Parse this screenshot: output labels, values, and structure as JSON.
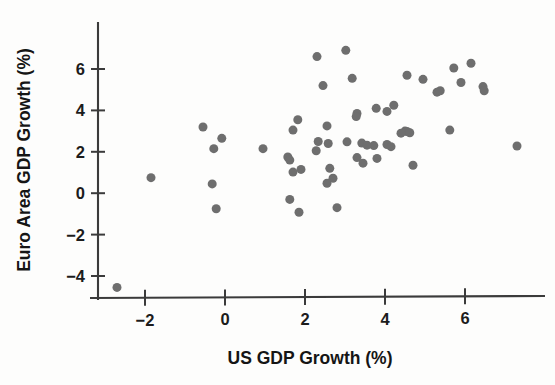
{
  "chart_data": {
    "type": "scatter",
    "title": "",
    "xlabel": "US GDP Growth (%)",
    "ylabel": "Euro Area GDP Growth (%)",
    "xlim": [
      -3.2,
      8.1
    ],
    "ylim": [
      -5.0,
      7.6
    ],
    "xticks": [
      -2,
      0,
      2,
      4,
      6
    ],
    "yticks": [
      -4,
      -2,
      0,
      2,
      4,
      6
    ],
    "xtick_labels": [
      "−2",
      "0",
      "2",
      "4",
      "6"
    ],
    "ytick_labels": [
      "−4",
      "−2",
      "0",
      "2",
      "4",
      "6"
    ],
    "grid": false,
    "legend": false,
    "marker": {
      "shape": "circle",
      "color": "#6e6e6e",
      "size": 9
    },
    "points": [
      {
        "x": -2.7,
        "y": -4.55
      },
      {
        "x": -1.85,
        "y": 0.75
      },
      {
        "x": -0.55,
        "y": 3.2
      },
      {
        "x": -0.08,
        "y": 2.65
      },
      {
        "x": -0.28,
        "y": 2.15
      },
      {
        "x": -0.32,
        "y": 0.45
      },
      {
        "x": -0.22,
        "y": -0.75
      },
      {
        "x": 0.95,
        "y": 2.15
      },
      {
        "x": 1.82,
        "y": 3.55
      },
      {
        "x": 1.7,
        "y": 3.05
      },
      {
        "x": 1.57,
        "y": 1.75
      },
      {
        "x": 1.62,
        "y": 1.6
      },
      {
        "x": 1.7,
        "y": 1.02
      },
      {
        "x": 1.9,
        "y": 1.15
      },
      {
        "x": 1.62,
        "y": -0.3
      },
      {
        "x": 1.85,
        "y": -0.92
      },
      {
        "x": 2.3,
        "y": 6.6
      },
      {
        "x": 2.45,
        "y": 5.2
      },
      {
        "x": 2.55,
        "y": 3.25
      },
      {
        "x": 2.33,
        "y": 2.5
      },
      {
        "x": 2.58,
        "y": 2.4
      },
      {
        "x": 2.28,
        "y": 2.05
      },
      {
        "x": 2.62,
        "y": 1.2
      },
      {
        "x": 2.7,
        "y": 0.72
      },
      {
        "x": 2.55,
        "y": 0.48
      },
      {
        "x": 2.8,
        "y": -0.7
      },
      {
        "x": 3.02,
        "y": 6.9
      },
      {
        "x": 3.18,
        "y": 5.55
      },
      {
        "x": 3.3,
        "y": 3.85
      },
      {
        "x": 3.28,
        "y": 3.7
      },
      {
        "x": 3.05,
        "y": 2.48
      },
      {
        "x": 3.42,
        "y": 2.42
      },
      {
        "x": 3.3,
        "y": 1.72
      },
      {
        "x": 3.45,
        "y": 1.45
      },
      {
        "x": 3.78,
        "y": 4.1
      },
      {
        "x": 3.72,
        "y": 2.3
      },
      {
        "x": 3.55,
        "y": 2.32
      },
      {
        "x": 3.8,
        "y": 1.68
      },
      {
        "x": 4.05,
        "y": 3.95
      },
      {
        "x": 4.22,
        "y": 4.25
      },
      {
        "x": 4.05,
        "y": 2.35
      },
      {
        "x": 4.15,
        "y": 2.25
      },
      {
        "x": 4.5,
        "y": 3.0
      },
      {
        "x": 4.55,
        "y": 2.98
      },
      {
        "x": 4.62,
        "y": 2.92
      },
      {
        "x": 4.4,
        "y": 2.9
      },
      {
        "x": 4.7,
        "y": 1.35
      },
      {
        "x": 4.55,
        "y": 5.7
      },
      {
        "x": 4.95,
        "y": 5.5
      },
      {
        "x": 5.3,
        "y": 4.88
      },
      {
        "x": 5.38,
        "y": 4.95
      },
      {
        "x": 5.62,
        "y": 3.05
      },
      {
        "x": 5.72,
        "y": 6.05
      },
      {
        "x": 5.9,
        "y": 5.35
      },
      {
        "x": 6.15,
        "y": 6.28
      },
      {
        "x": 6.45,
        "y": 5.15
      },
      {
        "x": 6.48,
        "y": 4.95
      },
      {
        "x": 7.3,
        "y": 2.28
      }
    ]
  },
  "axes": {
    "x_title": "US GDP Growth (%)",
    "y_title": "Euro Area GDP Growth (%)"
  }
}
